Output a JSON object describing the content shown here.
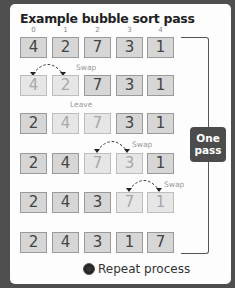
{
  "title": "Example bubble sort pass",
  "indices": [
    "0",
    "1",
    "2",
    "3",
    "4"
  ],
  "rows": [
    {
      "values": [
        "4",
        "2",
        "7",
        "3",
        "1"
      ],
      "faded": [
        false,
        false,
        false,
        false,
        false
      ]
    },
    {
      "values": [
        "4",
        "2",
        "7",
        "3",
        "1"
      ],
      "faded": [
        true,
        true,
        false,
        false,
        false
      ]
    },
    {
      "values": [
        "2",
        "4",
        "7",
        "3",
        "1"
      ],
      "faded": [
        false,
        true,
        true,
        false,
        false
      ]
    },
    {
      "values": [
        "2",
        "4",
        "7",
        "3",
        "1"
      ],
      "faded": [
        false,
        false,
        true,
        true,
        false
      ]
    },
    {
      "values": [
        "2",
        "4",
        "3",
        "7",
        "1"
      ],
      "faded": [
        false,
        false,
        false,
        true,
        true
      ]
    },
    {
      "values": [
        "2",
        "4",
        "3",
        "1",
        "7"
      ],
      "faded": [
        false,
        false,
        false,
        false,
        false
      ]
    }
  ],
  "annotations": [
    {
      "label": "Swap",
      "between": [
        0,
        1
      ],
      "above_row": 1
    },
    {
      "label": "Leave",
      "between": [
        1,
        2
      ],
      "above_row": 2
    },
    {
      "label": "Swap",
      "between": [
        2,
        3
      ],
      "above_row": 3
    },
    {
      "label": "Swap",
      "between": [
        3,
        4
      ],
      "above_row": 4
    }
  ],
  "labels": {
    "swap1": "Swap",
    "leave": "Leave",
    "swap2": "Swap",
    "swap3": "Swap"
  },
  "pass_badge": {
    "line1": "One",
    "line2": "pass"
  },
  "repeat": {
    "label": "Repeat process",
    "icon": "circle-icon"
  },
  "colors": {
    "background": "#4f4f4f",
    "card": "#fdfdfd",
    "box": "#d6d6d6",
    "box_faded": "#e6e6e6",
    "badge": "#4c4c4c"
  }
}
